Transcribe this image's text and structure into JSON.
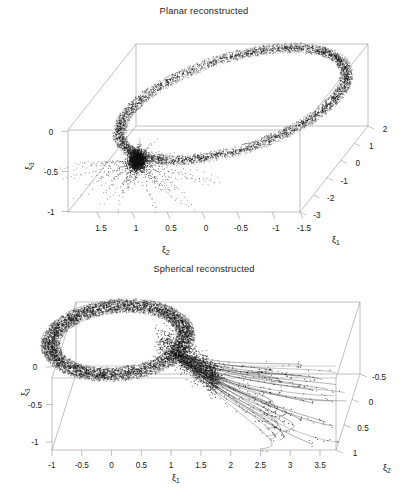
{
  "figure": {
    "width": 408,
    "height": 503,
    "background": "#ffffff",
    "ink": "#1a1a1a",
    "box_line_color": "#8e8e8e",
    "point_color": "#141414",
    "caption_fragment": ""
  },
  "panels": [
    {
      "id": "planar",
      "title": "Planar reconstructed",
      "axes": {
        "vertical": {
          "name": "ξ",
          "sub": "3",
          "ticks": [
            "0",
            "-0.5",
            "-1"
          ],
          "values": [
            0,
            -0.5,
            -1
          ]
        },
        "horizontal": {
          "name": "ξ",
          "sub": "2",
          "ticks": [
            "1.5",
            "1",
            "0.5",
            "0",
            "-0.5",
            "-1",
            "-1.5"
          ],
          "values": [
            1.5,
            1,
            0.5,
            0,
            -0.5,
            -1,
            -1.5
          ]
        },
        "depth": {
          "name": "ξ",
          "sub": "1",
          "ticks": [
            "2",
            "1",
            "0",
            "-1",
            "-2",
            "-3"
          ],
          "values": [
            2,
            1,
            0,
            -1,
            -2,
            -3
          ]
        }
      }
    },
    {
      "id": "spherical",
      "title": "Spherical reconstructed",
      "axes": {
        "vertical": {
          "name": "ξ",
          "sub": "3",
          "ticks": [
            "0",
            "-0.5",
            "-1"
          ],
          "values": [
            0,
            -0.5,
            -1
          ]
        },
        "horizontal": {
          "name": "ξ",
          "sub": "1",
          "ticks": [
            "-1",
            "-0.5",
            "0",
            "0.5",
            "1",
            "1.5",
            "2",
            "2.5",
            "3",
            "3.5"
          ],
          "values": [
            -1,
            -0.5,
            0,
            0.5,
            1,
            1.5,
            2,
            2.5,
            3,
            3.5
          ]
        },
        "depth": {
          "name": "ξ",
          "sub": "2",
          "ticks": [
            "-0.5",
            "0",
            "0.5",
            "1"
          ],
          "values": [
            -0.5,
            0,
            0.5,
            1
          ]
        }
      }
    }
  ],
  "chart_data": {
    "type": "scatter",
    "projection": "3d",
    "grid": false,
    "legend": null,
    "subplots": [
      {
        "name": "planar",
        "title": "Planar reconstructed",
        "xlabel": "ξ2",
        "ylabel": "ξ3",
        "zlabel": "ξ1",
        "xlim": [
          -1.75,
          1.75
        ],
        "ylim": [
          -1.15,
          0.35
        ],
        "zlim": [
          -3.4,
          2.4
        ],
        "description": "A dense noisy toroidal ring of black points forming a large tilted ellipse that spans the 3D box, together with a dark convergent knot near xi2 = 1.1, xi3 = -0.15 from which sparse radial filaments spray downward and outward.",
        "features": [
          {
            "kind": "torus-ring",
            "center_xi2": -0.1,
            "center_xi3": 0.05,
            "major_radius": 1.45,
            "minor_radius": 0.17,
            "point_count": 9000
          },
          {
            "kind": "radial-spray",
            "origin_xi2": 1.1,
            "origin_xi3": -0.12,
            "spread": 0.85,
            "filament_count": 46,
            "point_count": 2400
          }
        ]
      },
      {
        "name": "spherical",
        "title": "Spherical reconstructed",
        "xlabel": "ξ1",
        "ylabel": "ξ3",
        "zlabel": "ξ2",
        "xlim": [
          -1.25,
          3.8
        ],
        "ylim": [
          -1.2,
          0.35
        ],
        "zlim": [
          -0.8,
          1.2
        ],
        "description": "A thick dense toroidal annulus of black points occupying the left third of the box near xi1 between -1 and 1, from which a broad fan of thin curved trajectory lines with sparse scattered points streams to the lower right, reaching xi1 above 3.5.",
        "features": [
          {
            "kind": "torus-ring",
            "center_xi1": -0.05,
            "center_xi3": 0.12,
            "major_radius": 1.05,
            "minor_radius": 0.26,
            "point_count": 11000
          },
          {
            "kind": "trajectory-fan",
            "origin_xi1": 1.05,
            "origin_xi3": -0.05,
            "line_count": 34,
            "terminal_xi1_max": 3.6,
            "point_count": 1500
          }
        ]
      }
    ]
  }
}
